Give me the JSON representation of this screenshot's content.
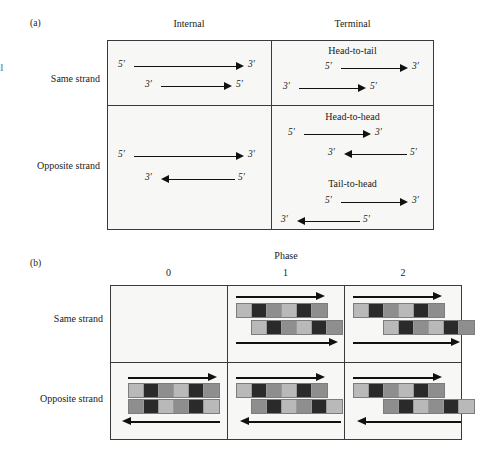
{
  "figure": {
    "panel_a": {
      "letter": "(a)",
      "clipped_left_fragment": "al",
      "column_headers": [
        "Internal",
        "Terminal"
      ],
      "row_labels": [
        "Same strand",
        "Opposite strand"
      ],
      "cells": [
        {
          "row": "Same strand",
          "column": "Internal",
          "title": "",
          "arrows": [
            {
              "left_label": "5′",
              "right_label": "3′",
              "direction": "right"
            },
            {
              "left_label": "3′",
              "right_label": "5′",
              "direction": "right"
            }
          ]
        },
        {
          "row": "Same strand",
          "column": "Terminal",
          "title": "Head-to-tail",
          "arrows": [
            {
              "left_label": "5′",
              "right_label": "3′",
              "direction": "right"
            },
            {
              "left_label": "3′",
              "right_label": "5′",
              "direction": "right"
            }
          ]
        },
        {
          "row": "Opposite strand",
          "column": "Internal",
          "title": "",
          "arrows": [
            {
              "left_label": "5′",
              "right_label": "3′",
              "direction": "right"
            },
            {
              "left_label": "3′",
              "right_label": "5′",
              "direction": "left"
            }
          ]
        },
        {
          "row": "Opposite strand",
          "column": "Terminal",
          "title": "Head-to-head",
          "arrows": [
            {
              "left_label": "5′",
              "right_label": "3′",
              "direction": "right"
            },
            {
              "left_label": "3′",
              "right_label": "5′",
              "direction": "left"
            }
          ]
        },
        {
          "row": "Opposite strand",
          "column": "Terminal",
          "title": "Tail-to-head",
          "arrows": [
            {
              "left_label": "5′",
              "right_label": "3′",
              "direction": "right"
            },
            {
              "left_label": "3′",
              "right_label": "5′",
              "direction": "left"
            }
          ]
        }
      ]
    },
    "panel_b": {
      "letter": "(b)",
      "super_header": "Phase",
      "column_headers": [
        "0",
        "1",
        "2"
      ],
      "row_labels": [
        "Same strand",
        "Opposite strand"
      ],
      "block_pattern": [
        "l",
        "d",
        "m",
        "l",
        "d",
        "m"
      ],
      "cells": [
        {
          "row": "Same strand",
          "phase": "0",
          "empty": true
        },
        {
          "row": "Same strand",
          "phase": "1",
          "empty": false,
          "top_arrow_direction": "right",
          "bottom_arrow_direction": "right",
          "top_row_offset_blocks": 0,
          "bottom_row_offset_blocks": 1
        },
        {
          "row": "Same strand",
          "phase": "2",
          "empty": false,
          "top_arrow_direction": "right",
          "bottom_arrow_direction": "right",
          "top_row_offset_blocks": 0,
          "bottom_row_offset_blocks": 2
        },
        {
          "row": "Opposite strand",
          "phase": "0",
          "empty": false,
          "top_arrow_direction": "right",
          "bottom_arrow_direction": "left",
          "top_row_offset_blocks": 0,
          "bottom_row_offset_blocks": 0
        },
        {
          "row": "Opposite strand",
          "phase": "1",
          "empty": false,
          "top_arrow_direction": "right",
          "bottom_arrow_direction": "left",
          "top_row_offset_blocks": 0,
          "bottom_row_offset_blocks": 1
        },
        {
          "row": "Opposite strand",
          "phase": "2",
          "empty": false,
          "top_arrow_direction": "right",
          "bottom_arrow_direction": "left",
          "top_row_offset_blocks": 0,
          "bottom_row_offset_blocks": 2
        }
      ]
    },
    "colors": {
      "block_light": "#b9b9b9",
      "block_dark": "#2a2a2a",
      "block_medium": "#8e8e8e",
      "cell_background": "#f7f7f5",
      "border": "#3a3a3a",
      "ink": "#111111"
    }
  }
}
